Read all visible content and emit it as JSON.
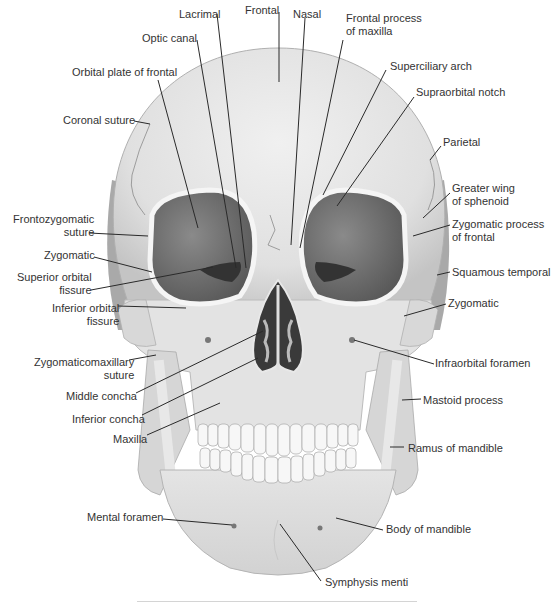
{
  "figure": {
    "colors": {
      "bone": "#e6e6e6",
      "bone_shadow": "#b9b9b9",
      "orbit": "#6b6b6b",
      "nasal_cavity": "#3a3a3a",
      "leader_line": "#2a2a2a",
      "label_text": "#333333"
    }
  },
  "labels": [
    {
      "id": "lacrimal",
      "text": "Lacrimal",
      "x": 179,
      "y": 8,
      "align": "left",
      "line": [
        [
          217,
          14
        ],
        [
          246,
          268
        ]
      ]
    },
    {
      "id": "frontal",
      "text": "Frontal",
      "x": 245,
      "y": 4,
      "align": "left",
      "line": [
        [
          279,
          12
        ],
        [
          279,
          82
        ]
      ]
    },
    {
      "id": "nasal",
      "text": "Nasal",
      "x": 293,
      "y": 8,
      "align": "left",
      "line": [
        [
          305,
          18
        ],
        [
          291,
          245
        ]
      ]
    },
    {
      "id": "frontal-process-of-maxilla",
      "text": "Frontal process\nof maxilla",
      "x": 346,
      "y": 12,
      "align": "left",
      "line": [
        [
          343,
          40
        ],
        [
          300,
          248
        ]
      ]
    },
    {
      "id": "optic-canal",
      "text": "Optic canal",
      "x": 142,
      "y": 32,
      "align": "left",
      "line": [
        [
          197,
          40
        ],
        [
          236,
          268
        ]
      ]
    },
    {
      "id": "superciliary-arch",
      "text": "Superciliary arch",
      "x": 390,
      "y": 60,
      "align": "left",
      "line": [
        [
          386,
          70
        ],
        [
          323,
          195
        ]
      ]
    },
    {
      "id": "orbital-plate-of-frontal",
      "text": "Orbital plate of frontal",
      "x": 72,
      "y": 66,
      "align": "left",
      "line": [
        [
          158,
          80
        ],
        [
          198,
          228
        ]
      ]
    },
    {
      "id": "supraorbital-notch",
      "text": "Supraorbital notch",
      "x": 416,
      "y": 86,
      "align": "left",
      "line": [
        [
          414,
          97
        ],
        [
          337,
          206
        ]
      ]
    },
    {
      "id": "coronal-suture",
      "text": "Coronal suture",
      "x": 63,
      "y": 114,
      "align": "left",
      "line": [
        [
          134,
          121
        ],
        [
          150,
          124
        ]
      ]
    },
    {
      "id": "parietal",
      "text": "Parietal",
      "x": 443,
      "y": 136,
      "align": "left",
      "line": [
        [
          441,
          146
        ],
        [
          430,
          160
        ]
      ]
    },
    {
      "id": "greater-wing-of-sphenoid",
      "text": "Greater wing\nof sphenoid",
      "x": 452,
      "y": 182,
      "align": "left",
      "line": [
        [
          450,
          193
        ],
        [
          423,
          218
        ]
      ]
    },
    {
      "id": "frontozygomatic-suture",
      "text": "Frontozygomatic\nsuture",
      "x": 13,
      "y": 213,
      "align": "right",
      "line": [
        [
          89,
          233
        ],
        [
          148,
          236
        ]
      ]
    },
    {
      "id": "zygomatic-process-of-frontal",
      "text": "Zygomatic process\nof frontal",
      "x": 452,
      "y": 218,
      "align": "left",
      "line": [
        [
          450,
          225
        ],
        [
          413,
          236
        ]
      ]
    },
    {
      "id": "zygomatic-left",
      "text": "Zygomatic",
      "x": 44,
      "y": 249,
      "align": "right",
      "line": [
        [
          94,
          257
        ],
        [
          152,
          272
        ]
      ]
    },
    {
      "id": "squamous-temporal",
      "text": "Squamous temporal",
      "x": 452,
      "y": 266,
      "align": "left",
      "line": [
        [
          450,
          272
        ],
        [
          437,
          275
        ]
      ]
    },
    {
      "id": "superior-orbital-fissure",
      "text": "Superior orbital\nfissure",
      "x": 17,
      "y": 271,
      "align": "right",
      "line": [
        [
          91,
          290
        ],
        [
          213,
          267
        ]
      ]
    },
    {
      "id": "zygomatic-right",
      "text": "Zygomatic",
      "x": 448,
      "y": 297,
      "align": "left",
      "line": [
        [
          446,
          304
        ],
        [
          404,
          316
        ]
      ]
    },
    {
      "id": "inferior-orbital-fissure",
      "text": "Inferior orbital\nfissure",
      "x": 52,
      "y": 302,
      "align": "right",
      "line": [
        [
          118,
          306
        ],
        [
          186,
          308
        ]
      ]
    },
    {
      "id": "zygomaticomaxillary-suture",
      "text": "Zygomaticomaxillary\nsuture",
      "x": 34,
      "y": 356,
      "align": "right",
      "line": [
        [
          129,
          360
        ],
        [
          156,
          355
        ]
      ]
    },
    {
      "id": "infraorbital-foramen",
      "text": "Infraorbital foramen",
      "x": 435,
      "y": 357,
      "align": "left",
      "line": [
        [
          434,
          364
        ],
        [
          354,
          340
        ]
      ]
    },
    {
      "id": "middle-concha",
      "text": "Middle concha",
      "x": 66,
      "y": 390,
      "align": "right",
      "line": [
        [
          136,
          393
        ],
        [
          263,
          331
        ]
      ]
    },
    {
      "id": "mastoid-process",
      "text": "Mastoid process",
      "x": 423,
      "y": 394,
      "align": "left",
      "line": [
        [
          421,
          399
        ],
        [
          402,
          400
        ]
      ]
    },
    {
      "id": "inferior-concha",
      "text": "Inferior concha",
      "x": 72,
      "y": 413,
      "align": "right",
      "line": [
        [
          142,
          415
        ],
        [
          258,
          358
        ]
      ]
    },
    {
      "id": "maxilla",
      "text": "Maxilla",
      "x": 113,
      "y": 433,
      "align": "right",
      "line": [
        [
          147,
          435
        ],
        [
          220,
          403
        ]
      ]
    },
    {
      "id": "ramus-of-mandible",
      "text": "Ramus of mandible",
      "x": 408,
      "y": 442,
      "align": "left",
      "line": [
        [
          404,
          447
        ],
        [
          390,
          447
        ]
      ]
    },
    {
      "id": "mental-foramen",
      "text": "Mental foramen",
      "x": 87,
      "y": 511,
      "align": "left",
      "line": [
        [
          163,
          519
        ],
        [
          232,
          525
        ]
      ]
    },
    {
      "id": "body-of-mandible",
      "text": "Body of mandible",
      "x": 386,
      "y": 523,
      "align": "left",
      "line": [
        [
          383,
          530
        ],
        [
          336,
          518
        ]
      ]
    },
    {
      "id": "symphysis-menti",
      "text": "Symphysis menti",
      "x": 325,
      "y": 576,
      "align": "left",
      "line": [
        [
          321,
          581
        ],
        [
          280,
          524
        ]
      ]
    }
  ]
}
